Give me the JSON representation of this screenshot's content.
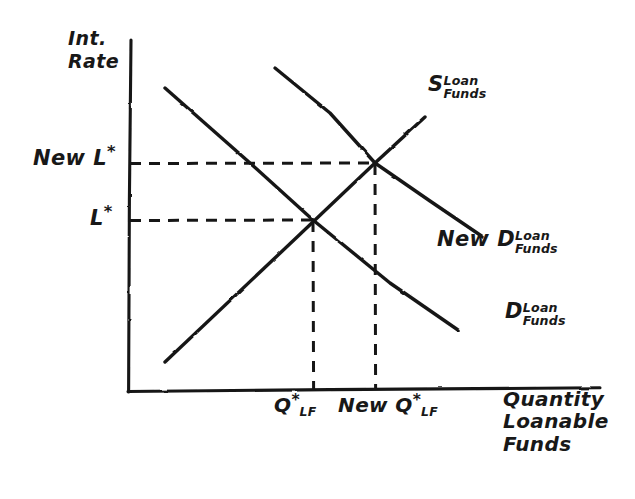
{
  "figure": {
    "kind": "hand-drawn-economics-diagram",
    "topic": "loanable funds market with increase in demand",
    "background_color": "#ffffff",
    "ink_color": "#181818"
  },
  "axes": {
    "y_axis_title_line1": "Int.",
    "y_axis_title_line2": "Rate",
    "x_axis_title_line1": "Quantity",
    "x_axis_title_line2": "Loanable",
    "x_axis_title_line3": "Funds",
    "origin": {
      "x": 128,
      "y": 392
    },
    "y_axis_top": {
      "x": 130,
      "y": 40
    },
    "x_axis_right": {
      "x": 600,
      "y": 388
    }
  },
  "y_ticks": [
    {
      "name": "new-equilibrium-rate",
      "prefix": "New ",
      "symbol": "L",
      "star": "*",
      "y": 163
    },
    {
      "name": "initial-equilibrium-rate",
      "prefix": "",
      "symbol": "L",
      "star": "*",
      "y": 220
    }
  ],
  "x_ticks": [
    {
      "name": "initial-equilibrium-quantity",
      "prefix": "",
      "symbol": "Q",
      "star": "*",
      "subscript": "LF",
      "x": 313
    },
    {
      "name": "new-equilibrium-quantity",
      "prefix": "New ",
      "symbol": "Q",
      "star": "*",
      "subscript": "LF",
      "x": 375
    }
  ],
  "curves": [
    {
      "name": "supply-loanable-funds",
      "label_main": "S",
      "label_sub_line1": "Loan",
      "label_sub_line2": "Funds",
      "slope": "upward",
      "start": {
        "x": 165,
        "y": 362
      },
      "end": {
        "x": 425,
        "y": 118
      }
    },
    {
      "name": "new-demand-loanable-funds",
      "label_main": "New D",
      "label_sub_line1": "Loan",
      "label_sub_line2": "Funds",
      "slope": "downward",
      "start": {
        "x": 275,
        "y": 68
      },
      "end": {
        "x": 483,
        "y": 237
      }
    },
    {
      "name": "original-demand-loanable-funds",
      "label_main": "D",
      "label_sub_line1": "Loan",
      "label_sub_line2": "Funds",
      "slope": "downward",
      "start": {
        "x": 165,
        "y": 88
      },
      "end": {
        "x": 458,
        "y": 330
      }
    }
  ],
  "equilibria": [
    {
      "name": "initial-equilibrium-point",
      "x": 313,
      "y": 220
    },
    {
      "name": "new-equilibrium-point",
      "x": 375,
      "y": 163
    }
  ],
  "dashed_guides": [
    {
      "name": "guide-h-new-rate",
      "from": {
        "x": 130,
        "y": 163
      },
      "to": {
        "x": 375,
        "y": 163
      }
    },
    {
      "name": "guide-h-initial-rate",
      "from": {
        "x": 130,
        "y": 220
      },
      "to": {
        "x": 313,
        "y": 220
      }
    },
    {
      "name": "guide-v-initial-quantity",
      "from": {
        "x": 313,
        "y": 220
      },
      "to": {
        "x": 313,
        "y": 391
      }
    },
    {
      "name": "guide-v-new-quantity",
      "from": {
        "x": 375,
        "y": 163
      },
      "to": {
        "x": 375,
        "y": 391
      }
    }
  ]
}
